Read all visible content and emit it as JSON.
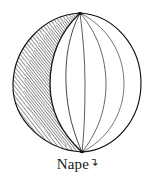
{
  "figure": {
    "title": "Nape",
    "caption": {
      "label": "Nape",
      "mark": "↴",
      "mark_name": "hook-flourish-mark"
    },
    "style": {
      "background_color": "#ffffff",
      "ink_color": "#1a1a1a",
      "line_color": "#2b2b2b",
      "hatch_color": "#3a3a3a",
      "rim_color": "#111111"
    },
    "geometry": {
      "top_apex": [
        80,
        13
      ],
      "bottom_apex": [
        82,
        152
      ],
      "circle_left": 12,
      "circle_right": 141,
      "circle_top": 13,
      "circle_bottom": 152
    },
    "elements": [
      {
        "name": "outer-rim",
        "kind": "circle-outline"
      },
      {
        "name": "shaded-crescent",
        "kind": "hatched-region",
        "side": "left"
      },
      {
        "name": "meridian-lines",
        "kind": "curves",
        "count": 5
      },
      {
        "name": "top-apex-node",
        "kind": "convergence-point"
      },
      {
        "name": "bottom-apex-node",
        "kind": "convergence-point"
      }
    ]
  }
}
